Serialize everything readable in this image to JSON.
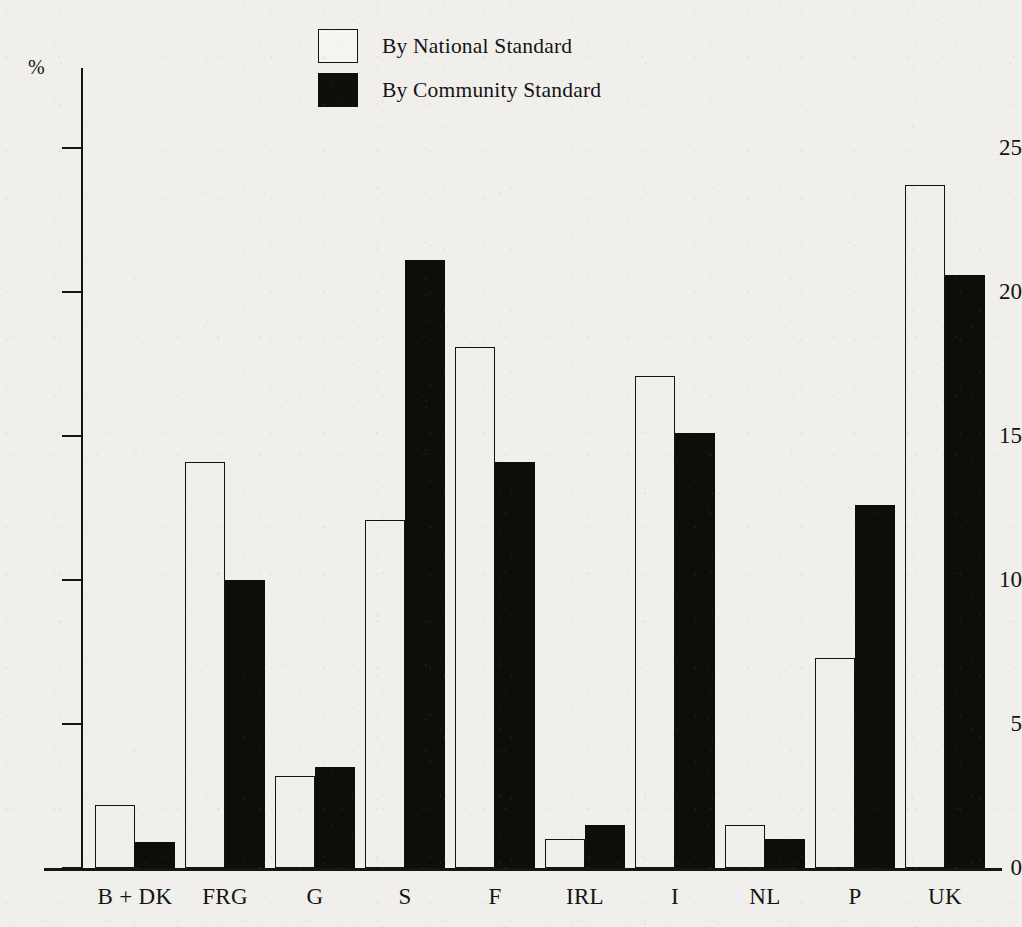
{
  "axis": {
    "unit_label": "%",
    "y_ticks": [
      0,
      5,
      10,
      15,
      20,
      25
    ]
  },
  "legend": {
    "items": [
      {
        "label": "By National Standard",
        "swatch": "open-square-icon",
        "color": "#ffffff"
      },
      {
        "label": "By Community Standard",
        "swatch": "filled-square-icon",
        "color": "#0f0d0a"
      }
    ]
  },
  "chart_data": {
    "type": "bar",
    "title": "",
    "subtitle": "",
    "xlabel": "",
    "ylabel": "%",
    "ylim": [
      0,
      27.8
    ],
    "grid": false,
    "legend_position": "top-center",
    "categories": [
      "B + DK",
      "FRG",
      "G",
      "S",
      "F",
      "IRL",
      "I",
      "NL",
      "P",
      "UK"
    ],
    "series": [
      {
        "name": "By National Standard",
        "color": "#ffffff",
        "values": [
          2.2,
          14.1,
          3.2,
          12.1,
          18.1,
          1.0,
          17.1,
          1.5,
          7.3,
          23.7
        ]
      },
      {
        "name": "By Community Standard",
        "color": "#0f0d0a",
        "values": [
          0.9,
          10.0,
          3.5,
          21.1,
          14.1,
          1.5,
          15.1,
          1.0,
          12.6,
          20.6
        ]
      }
    ]
  }
}
